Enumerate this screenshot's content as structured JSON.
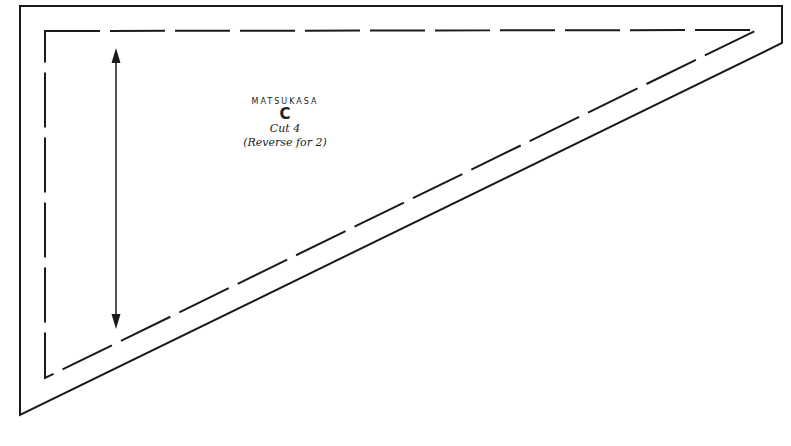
{
  "pattern": {
    "name": "MATSUKASA",
    "piece": "C",
    "cut": "Cut 4",
    "note": "(Reverse for 2)"
  },
  "symbols": {
    "grain_line": "double-headed-arrow",
    "cutting_line": "solid",
    "seam_line": "dashed"
  },
  "colors": {
    "line": "#1a1a1a",
    "background": "#ffffff"
  }
}
